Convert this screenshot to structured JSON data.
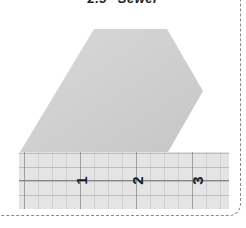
{
  "heading": {
    "title": "2.5\" Sewer"
  },
  "ruler": {
    "labels": [
      "1",
      "2",
      "3"
    ],
    "color": "#e4e4e4"
  },
  "fabric_shape": {
    "color": "#d0d0d0"
  }
}
